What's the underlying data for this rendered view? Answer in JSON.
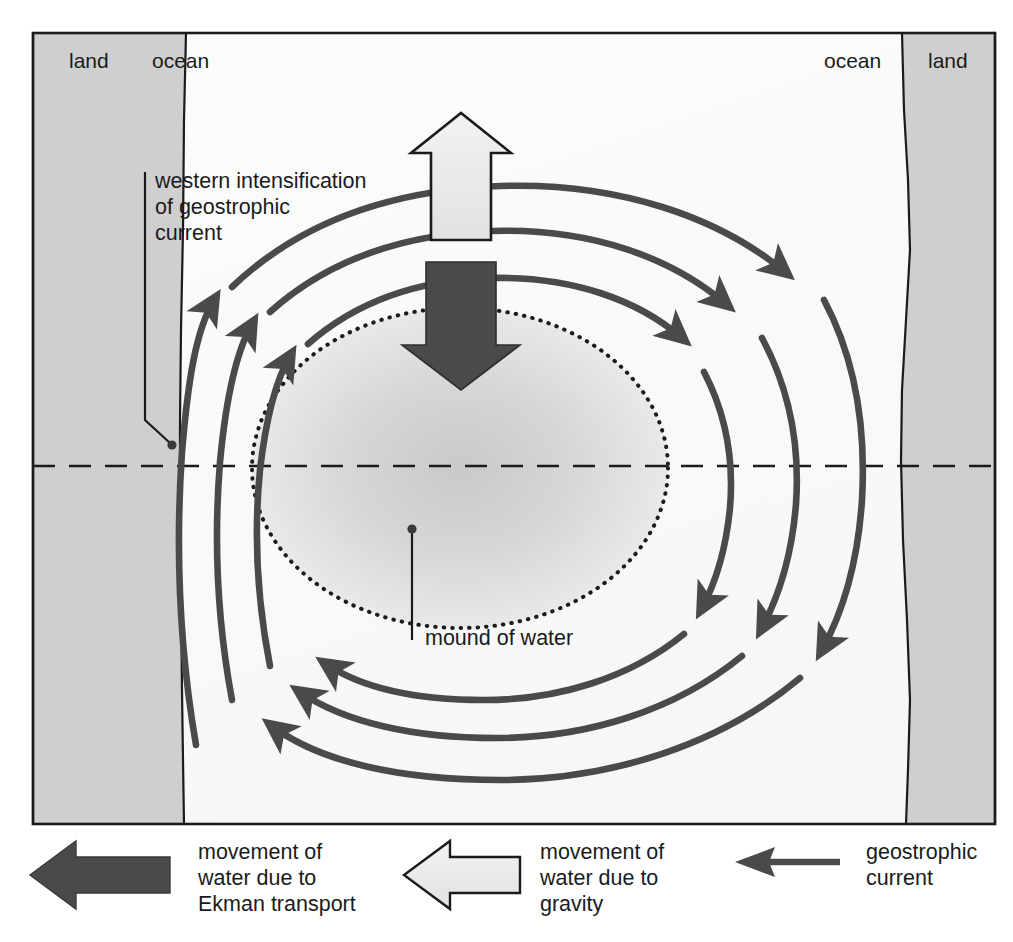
{
  "figure": {
    "title_visible": false
  },
  "map": {
    "land_left_label": "land",
    "land_right_label": "land",
    "ocean_left_label": "ocean",
    "ocean_right_label": "ocean",
    "center_latitude_line": "dashed"
  },
  "annotations": {
    "western_intensification": {
      "line1": "western intensification",
      "line2": "of geostrophic",
      "line3": "current"
    },
    "mound": {
      "label": "mound of water"
    }
  },
  "arrows": {
    "gravity_arrow_direction": "up",
    "ekman_arrow_direction": "down",
    "gyre_rotation": "clockwise"
  },
  "legend": {
    "items": [
      {
        "icon": "left-arrow-solid-dark",
        "line1": "movement of",
        "line2": "water due to",
        "line3": "Ekman transport"
      },
      {
        "icon": "left-arrow-outline-light",
        "line1": "movement of",
        "line2": "water due to",
        "line3": "gravity"
      },
      {
        "icon": "left-arrow-thin-line",
        "line1": "geostrophic",
        "line2": "current",
        "line3": ""
      }
    ]
  },
  "colors": {
    "land_fill": "#cfcfcf",
    "ocean_fill": "#fbfbfb",
    "frame_stroke": "#1b1b1b",
    "current_stroke": "#4a4a4a",
    "ekman_arrow_fill": "#4a4a4a",
    "gravity_arrow_fill": "#e8e8e8",
    "mound_inner": "#cdcdcd",
    "mound_outer": "#efefef",
    "text": "#1b1b1b"
  }
}
